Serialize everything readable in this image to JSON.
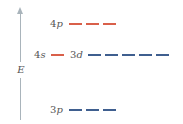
{
  "axis": {
    "label": "E",
    "color": "#a9b4bb"
  },
  "colors": {
    "red": "#d9604a",
    "blue": "#3f5f8f",
    "text": "#555555"
  },
  "levels": [
    {
      "id": "4p",
      "label_num": "4",
      "label_letter": "p",
      "orbitals": 3,
      "color": "red"
    },
    {
      "id": "4s",
      "label_num": "4",
      "label_letter": "s",
      "orbitals": 1,
      "color": "red"
    },
    {
      "id": "3d",
      "label_num": "3",
      "label_letter": "d",
      "orbitals": 5,
      "color": "blue"
    },
    {
      "id": "3p",
      "label_num": "3",
      "label_letter": "p",
      "orbitals": 3,
      "color": "blue"
    }
  ]
}
